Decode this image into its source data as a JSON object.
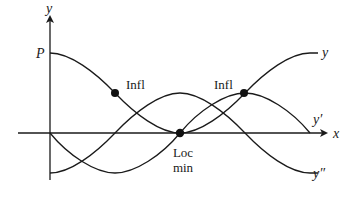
{
  "diagram": {
    "type": "function-and-derivatives",
    "axes": {
      "x_label": "x",
      "y_label": "y",
      "y_intercept_label": "P"
    },
    "curves": [
      {
        "id": "y",
        "label": "y",
        "description": "function, starts at P, decreasing to local min on x-axis, then increasing"
      },
      {
        "id": "y_prime",
        "label": "y′",
        "description": "first derivative, negative then zero at local min, then positive"
      },
      {
        "id": "y_double_prime",
        "label": "y″",
        "description": "second derivative, negative, rises to max at local min, then falls"
      }
    ],
    "annotations": [
      {
        "id": "infl-left",
        "label": "Infl"
      },
      {
        "id": "infl-right",
        "label": "Infl"
      },
      {
        "id": "loc-min",
        "label_line1": "Loc",
        "label_line2": "min"
      }
    ],
    "colors": {
      "ink": "#1a1a1a",
      "background": "#ffffff"
    }
  }
}
